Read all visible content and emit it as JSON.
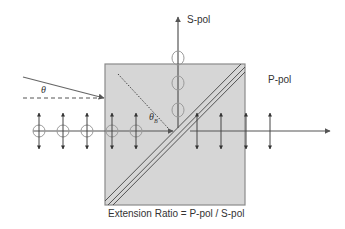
{
  "diagram": {
    "labels": {
      "s_pol": "S-pol",
      "p_pol": "P-pol",
      "theta": "θ",
      "theta_b": "θ",
      "theta_b_sub": "B",
      "caption": "Extension Ratio = P-pol / S-pol"
    },
    "colors": {
      "box_fill": "#d6d6d6",
      "box_stroke": "#8a8a8a",
      "line": "#555555",
      "circle": "#9a9a9a",
      "text": "#333333"
    },
    "elements": [
      "incident-ray",
      "normal-dashed-line",
      "beam-splitter-cube",
      "coating-diagonal",
      "s-pol-reflected-beam",
      "p-pol-transmitted-beam",
      "brewster-normal-dotted"
    ]
  }
}
